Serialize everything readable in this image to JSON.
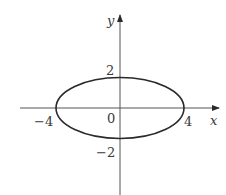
{
  "diagram": {
    "type": "ellipse-graph",
    "equation_implied": "x^2/16 + y^2/4 = 1",
    "axes": {
      "x_label": "x",
      "y_label": "y"
    },
    "ticks": {
      "x_neg": "−4",
      "x_pos": "4",
      "y_pos": "2",
      "y_neg": "−2",
      "origin": "0"
    },
    "ellipse": {
      "center": [
        0,
        0
      ],
      "semi_major_x": 4,
      "semi_minor_y": 2
    },
    "colors": {
      "axis": "#555555",
      "curve": "#2a2a2a",
      "text": "#3a3a3a"
    }
  }
}
